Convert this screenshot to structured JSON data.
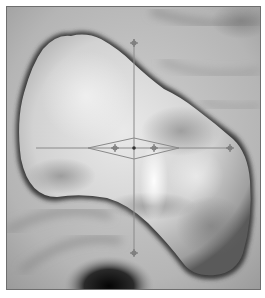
{
  "image": {
    "description": "Grayscale 3D surface rendering (virtual endoscopy view) of a lobulated polyp with a measurement crosshair overlay",
    "overlay": {
      "type": "crosshair-with-diamond",
      "line_color": "#8a8a8a",
      "center": [
        133,
        147
      ],
      "horizontal_line": {
        "x1": 35,
        "x2": 230,
        "y": 147
      },
      "vertical_line": {
        "x": 133,
        "y1": 38,
        "y2": 255
      },
      "diamond": {
        "left": 87,
        "right": 178,
        "top": 137,
        "bottom": 158
      },
      "handles": [
        "top",
        "bottom",
        "right",
        "diamond-left",
        "diamond-right"
      ]
    },
    "colors": {
      "background_tissue": "#b9b9b9",
      "polyp_highlight": "#f2f2f2",
      "shadow": "#1a1a1a",
      "frame_border": "#6e6e6e"
    }
  }
}
